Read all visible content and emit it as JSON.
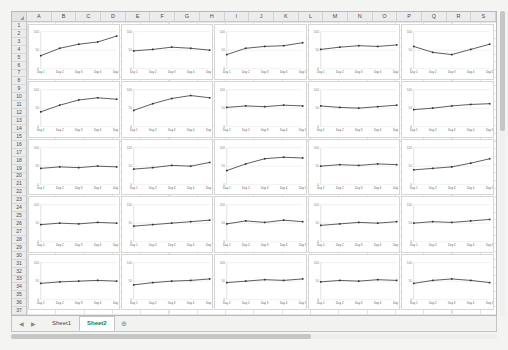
{
  "grid": {
    "columns": [
      "A",
      "B",
      "C",
      "D",
      "E",
      "F",
      "G",
      "H",
      "I",
      "J",
      "K",
      "L",
      "M",
      "N",
      "O",
      "P",
      "Q",
      "R",
      "S"
    ],
    "rows": [
      1,
      2,
      3,
      4,
      5,
      6,
      7,
      8,
      9,
      10,
      11,
      12,
      13,
      14,
      15,
      16,
      17,
      18,
      19,
      20,
      21,
      22,
      23,
      24,
      25,
      26,
      27,
      28,
      29,
      30,
      31,
      32,
      33,
      34,
      35,
      36,
      37
    ]
  },
  "tabs": {
    "prev_label": "◀",
    "next_label": "▶",
    "sheets": [
      {
        "label": "Sheet1",
        "active": false
      },
      {
        "label": "Sheet2",
        "active": true
      }
    ],
    "add_label": "⊕"
  },
  "chart_data": {
    "type": "line",
    "title": "",
    "xlabel": "",
    "ylabel": "",
    "categories": [
      "Day 1",
      "Day 2",
      "Day 3",
      "Day 4",
      "Day 5"
    ],
    "yticks": [
      0,
      50,
      100
    ],
    "ylim": [
      0,
      100
    ],
    "grid": true,
    "legend": "none",
    "panels": [
      {
        "title": "Daisy Allen",
        "values": [
          35,
          55,
          66,
          72,
          88
        ]
      },
      {
        "title": "Joe Perry",
        "values": [
          48,
          52,
          58,
          55,
          50
        ]
      },
      {
        "title": "Joe Long",
        "values": [
          38,
          55,
          60,
          62,
          70
        ]
      },
      {
        "title": "Stephen Mitchell",
        "values": [
          52,
          58,
          62,
          60,
          64
        ]
      },
      {
        "title": "Thelma Carter",
        "values": [
          60,
          44,
          38,
          52,
          66
        ]
      },
      {
        "title": "Susie Fitzgerald",
        "values": [
          40,
          58,
          72,
          78,
          74
        ]
      },
      {
        "title": "Gerard Johnson",
        "values": [
          44,
          62,
          76,
          84,
          78
        ]
      },
      {
        "title": "Mary Young",
        "values": [
          52,
          56,
          54,
          58,
          56
        ]
      },
      {
        "title": "Robert Mcdonald",
        "values": [
          56,
          52,
          50,
          54,
          58
        ]
      },
      {
        "title": "Robert Hall",
        "values": [
          46,
          50,
          56,
          60,
          62
        ]
      },
      {
        "title": "Jennifer Head",
        "values": [
          44,
          48,
          46,
          50,
          48
        ]
      },
      {
        "title": "Todd Fowler",
        "values": [
          42,
          46,
          52,
          50,
          60
        ]
      },
      {
        "title": "Margaret Adams",
        "values": [
          38,
          56,
          70,
          74,
          72
        ]
      },
      {
        "title": "William Smith",
        "values": [
          50,
          54,
          52,
          56,
          54
        ]
      },
      {
        "title": "Douglas Taylor",
        "values": [
          40,
          44,
          48,
          58,
          70
        ]
      },
      {
        "title": "Evelyn Reyes",
        "values": [
          46,
          50,
          48,
          52,
          50
        ]
      },
      {
        "title": "Peter Gonzales",
        "values": [
          42,
          46,
          50,
          54,
          58
        ]
      },
      {
        "title": "Victor Klein",
        "values": [
          48,
          56,
          52,
          58,
          54
        ]
      },
      {
        "title": "Christopher Anderson",
        "values": [
          44,
          48,
          52,
          50,
          54
        ]
      },
      {
        "title": "Raul Jones",
        "values": [
          50,
          54,
          52,
          56,
          60
        ]
      },
      {
        "title": "Bernard Jones",
        "values": [
          44,
          48,
          50,
          52,
          50
        ]
      },
      {
        "title": "Norma Young",
        "values": [
          40,
          46,
          50,
          52,
          56
        ]
      },
      {
        "title": "Francis Valencia",
        "values": [
          46,
          50,
          54,
          52,
          56
        ]
      },
      {
        "title": "Shannon Taylor",
        "values": [
          48,
          52,
          50,
          54,
          52
        ]
      },
      {
        "title": "Sarah Clark",
        "values": [
          44,
          52,
          56,
          52,
          46
        ]
      }
    ]
  }
}
